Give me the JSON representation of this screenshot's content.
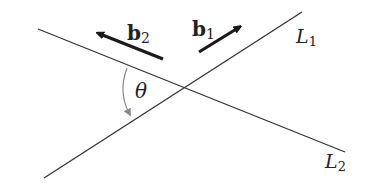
{
  "diagram": {
    "lines": [
      {
        "id": "L1",
        "label": "L",
        "subscript": "1"
      },
      {
        "id": "L2",
        "label": "L",
        "subscript": "2"
      }
    ],
    "vectors": [
      {
        "id": "b1",
        "label": "b",
        "subscript": "1"
      },
      {
        "id": "b2",
        "label": "b",
        "subscript": "2"
      }
    ],
    "angle": {
      "label": "θ"
    },
    "colors": {
      "line": "#333333",
      "arrow": "#1a1a1a",
      "arc": "#888888",
      "background": "#ffffff"
    }
  }
}
